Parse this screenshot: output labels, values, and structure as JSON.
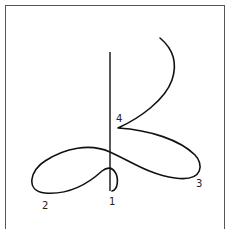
{
  "diagram": {
    "type": "curve-path-diagram",
    "stroke_color": "#111111",
    "frame_color": "#555555",
    "labels": [
      {
        "id": "1",
        "text": "1",
        "x": 109,
        "y": 197
      },
      {
        "id": "2",
        "text": "2",
        "x": 42,
        "y": 201
      },
      {
        "id": "3",
        "text": "3",
        "x": 196,
        "y": 179
      },
      {
        "id": "4",
        "text": "4",
        "x": 116,
        "y": 114
      }
    ]
  }
}
